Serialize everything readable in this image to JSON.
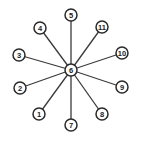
{
  "diagram": {
    "type": "star-graph",
    "center": {
      "id": "6",
      "label": "6",
      "x": 71,
      "y": 70
    },
    "nodes": [
      {
        "id": "1",
        "label": "1",
        "x": 39,
        "y": 114
      },
      {
        "id": "2",
        "label": "2",
        "x": 20,
        "y": 88
      },
      {
        "id": "3",
        "label": "3",
        "x": 19,
        "y": 55
      },
      {
        "id": "4",
        "label": "4",
        "x": 40,
        "y": 28
      },
      {
        "id": "5",
        "label": "5",
        "x": 71,
        "y": 15
      },
      {
        "id": "7",
        "label": "7",
        "x": 71,
        "y": 125
      },
      {
        "id": "8",
        "label": "8",
        "x": 102,
        "y": 114
      },
      {
        "id": "9",
        "label": "9",
        "x": 122,
        "y": 87
      },
      {
        "id": "10",
        "label": "10",
        "x": 122,
        "y": 53
      },
      {
        "id": "11",
        "label": "11",
        "x": 102,
        "y": 27
      }
    ],
    "node_radius": 6,
    "colors": {
      "stroke": "#2a2a2a",
      "fill": "#ffffff",
      "background": "#ffffff"
    }
  }
}
